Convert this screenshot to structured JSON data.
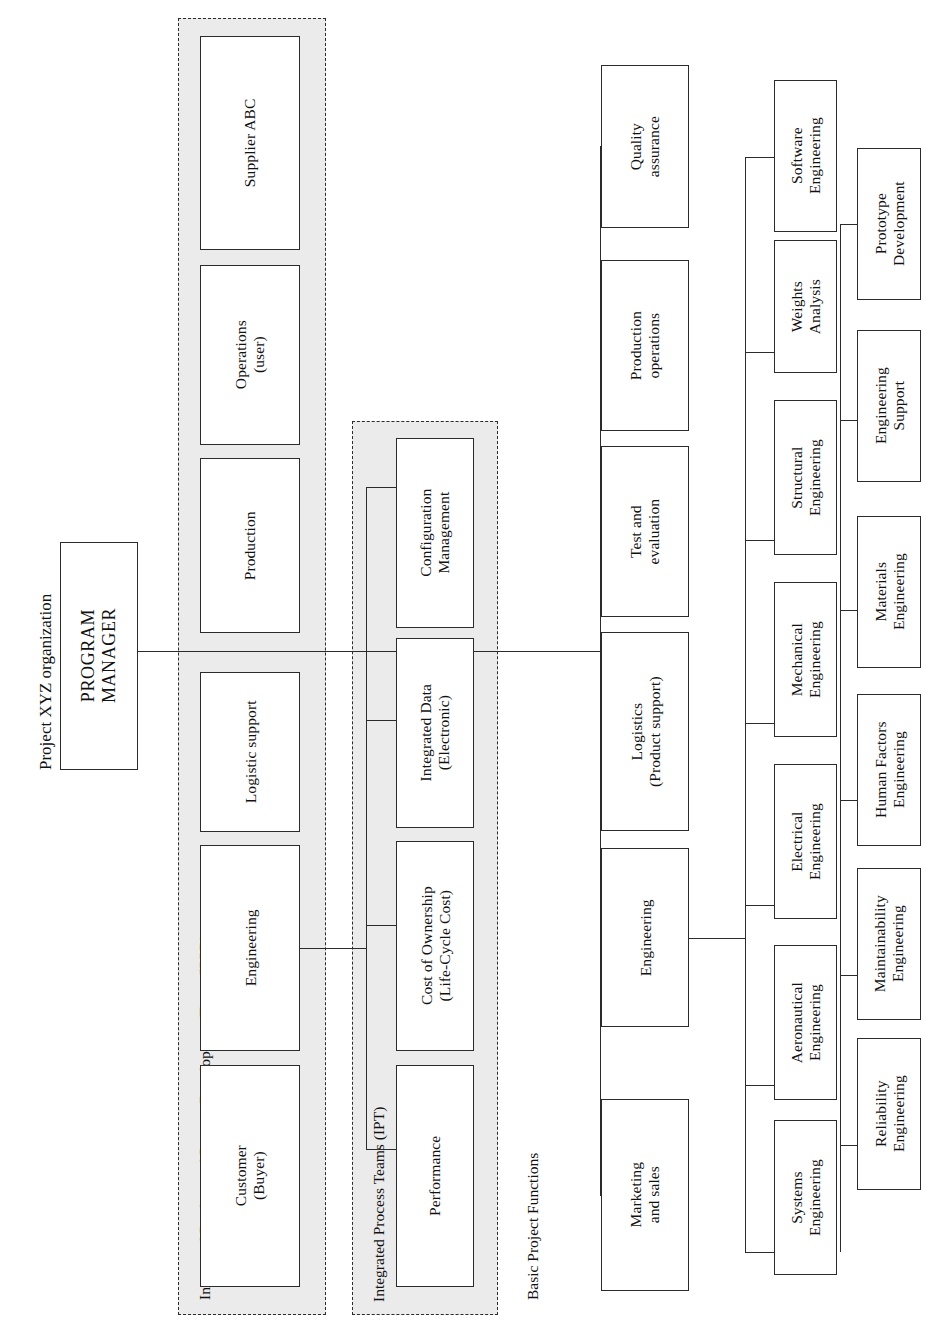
{
  "diagram": {
    "title": "Project XYZ organization",
    "orientation": "rotated-90-ccw",
    "labels": {
      "ippd_group": "Integrated Product and Process Development Team (IPPD)",
      "ipt_group": "Integrated Process Teams (IPT)",
      "basic_functions": "Basic Project Functions"
    },
    "root": {
      "name": "PROGRAM MANAGER",
      "line1": "PROGRAM",
      "line2": "MANAGER"
    },
    "ippd_members": [
      {
        "line1": "Customer",
        "line2": "(Buyer)"
      },
      {
        "line1": "Engineering",
        "line2": ""
      },
      {
        "line1": "Logistic support",
        "line2": ""
      },
      {
        "line1": "Production",
        "line2": ""
      },
      {
        "line1": "Operations",
        "line2": "(user)"
      },
      {
        "line1": "Supplier ABC",
        "line2": ""
      }
    ],
    "ipt_members": [
      {
        "line1": "Performance",
        "line2": ""
      },
      {
        "line1": "Cost of Ownership",
        "line2": "(Life-Cycle Cost)"
      },
      {
        "line1": "Integrated Data",
        "line2": "(Electronic)"
      },
      {
        "line1": "Configuration",
        "line2": "Management"
      }
    ],
    "basic_functions": [
      {
        "line1": "Marketing",
        "line2": "and sales"
      },
      {
        "line1": "Engineering",
        "line2": ""
      },
      {
        "line1": "Logistics",
        "line2": "(Product support)"
      },
      {
        "line1": "Test and",
        "line2": "evaluation"
      },
      {
        "line1": "Production",
        "line2": "operations"
      },
      {
        "line1": "Quality",
        "line2": "assurance"
      }
    ],
    "engineering_disciplines": [
      {
        "line1": "Systems",
        "line2": "Engineering"
      },
      {
        "line1": "Aeronautical",
        "line2": "Engineering"
      },
      {
        "line1": "Electrical",
        "line2": "Engineering"
      },
      {
        "line1": "Mechanical",
        "line2": "Engineering"
      },
      {
        "line1": "Structural",
        "line2": "Engineering"
      },
      {
        "line1": "Weights",
        "line2": "Analysis"
      },
      {
        "line1": "Software",
        "line2": "Engineering"
      }
    ],
    "engineering_support": [
      {
        "line1": "Reliability",
        "line2": "Engineering"
      },
      {
        "line1": "Maintainability",
        "line2": "Engineering"
      },
      {
        "line1": "Human Factors",
        "line2": "Engineering"
      },
      {
        "line1": "Materials",
        "line2": "Engineering"
      },
      {
        "line1": "Engineering",
        "line2": "Support"
      },
      {
        "line1": "Prototype",
        "line2": "Development"
      }
    ],
    "colors": {
      "line": "#2b2b2b",
      "group_fill": "#ebebeb",
      "box_fill": "#ffffff",
      "text": "#111111"
    }
  }
}
